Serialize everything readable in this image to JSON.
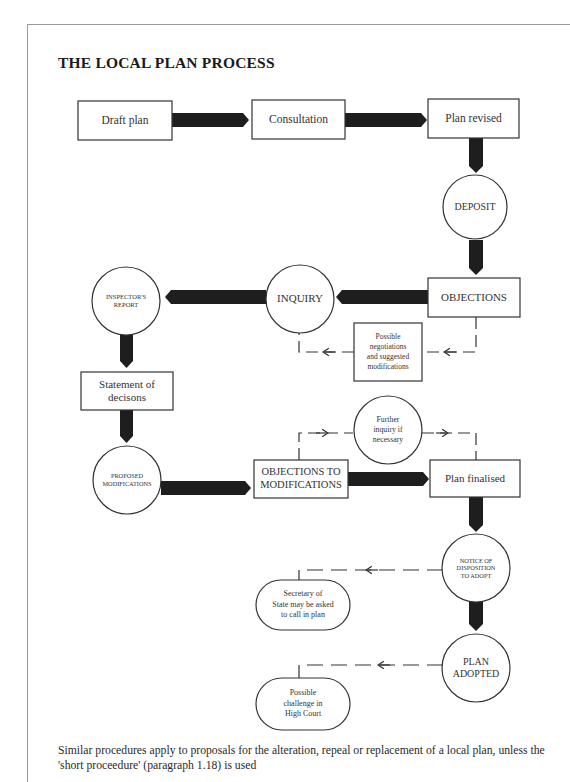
{
  "title": "THE LOCAL PLAN PROCESS",
  "nodes": {
    "draft_plan": "Draft plan",
    "consultation": "Consultation",
    "plan_revised": "Plan revised",
    "deposit": "DEPOSIT",
    "objections": "OBJECTIONS",
    "inquiry": "INQUIRY",
    "inspectors_report_1": "INSPECTOR'S",
    "inspectors_report_2": "REPORT",
    "possible_negotiations_1": "Possible",
    "possible_negotiations_2": "negotiations",
    "possible_negotiations_3": "and suggested",
    "possible_negotiations_4": "modifications",
    "statement_1": "Statement of",
    "statement_2": "decisons",
    "further_inquiry_1": "Further",
    "further_inquiry_2": "inquiry if",
    "further_inquiry_3": "necessary",
    "proposed_mods_1": "PROPOSED",
    "proposed_mods_2": "MODIFICATIONS",
    "objections_to_mods_1": "OBJECTIONS TO",
    "objections_to_mods_2": "MODIFICATIONS",
    "plan_finalised": "Plan finalised",
    "notice_1": "NOTICE OF",
    "notice_2": "DISPOSITION",
    "notice_3": "TO ADOPT",
    "secretary_1": "Secretary of",
    "secretary_2": "State may be asked",
    "secretary_3": "to call in plan",
    "plan_adopted_1": "PLAN",
    "plan_adopted_2": "ADOPTED",
    "challenge_1": "Possible",
    "challenge_2": "challenge in",
    "challenge_3": "High Court"
  },
  "flow": [
    [
      "Draft plan",
      "Consultation"
    ],
    [
      "Consultation",
      "Plan revised"
    ],
    [
      "Plan revised",
      "DEPOSIT"
    ],
    [
      "DEPOSIT",
      "OBJECTIONS"
    ],
    [
      "OBJECTIONS",
      "INQUIRY"
    ],
    [
      "INQUIRY",
      "INSPECTOR'S REPORT"
    ],
    [
      "INSPECTOR'S REPORT",
      "Statement of decisons"
    ],
    [
      "Statement of decisons",
      "PROPOSED MODIFICATIONS"
    ],
    [
      "PROPOSED MODIFICATIONS",
      "OBJECTIONS TO MODIFICATIONS"
    ],
    [
      "OBJECTIONS TO MODIFICATIONS",
      "Plan finalised"
    ],
    [
      "Plan finalised",
      "NOTICE OF DISPOSITION TO ADOPT"
    ],
    [
      "NOTICE OF DISPOSITION TO ADOPT",
      "PLAN ADOPTED"
    ]
  ],
  "optional_flow": [
    [
      "OBJECTIONS",
      "Possible negotiations and suggested modifications",
      "INQUIRY"
    ],
    [
      "OBJECTIONS TO MODIFICATIONS",
      "Further inquiry if necessary",
      "Plan finalised"
    ],
    [
      "NOTICE OF DISPOSITION TO ADOPT",
      "Secretary of State may be asked to call in plan"
    ],
    [
      "PLAN ADOPTED",
      "Possible challenge in High Court"
    ]
  ],
  "footnote": "Similar procedures apply to proposals for the alteration, repeal or replacement of a local plan, unless the 'short proceedure' (paragraph 1.18) is used",
  "colors": {
    "arrow": "#1e1e1e",
    "stroke": "#333333",
    "frame": "#9a9a9a"
  }
}
